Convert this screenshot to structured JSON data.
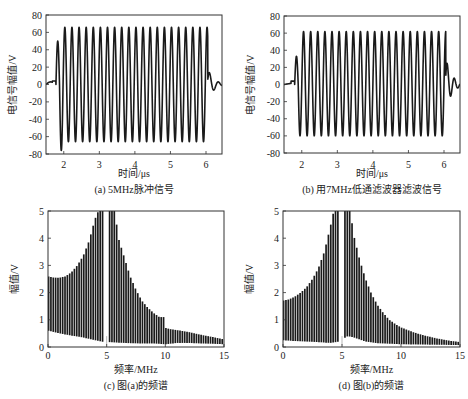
{
  "chart_data": [
    {
      "id": "a",
      "type": "line",
      "caption": "(a)  5MHz脉冲信号",
      "xlabel": "时间/μs",
      "ylabel": "电信号幅值/V",
      "xlim": [
        1.5,
        6.45
      ],
      "ylim": [
        -80,
        80
      ],
      "xticks": [
        2,
        3,
        4,
        5,
        6
      ],
      "yticks": [
        -80,
        -60,
        -40,
        -20,
        0,
        20,
        40,
        60,
        80
      ],
      "signal": {
        "frequency_mhz": 5,
        "start_us": 1.78,
        "end_us": 6.05,
        "peak_max": 66,
        "peak_min": -66,
        "first_peak": 50,
        "first_trough": -76,
        "ringdown_peak": 18,
        "inner_trough": -42
      }
    },
    {
      "id": "b",
      "type": "line",
      "caption": "(b)  用7MHz低通滤波器滤波信号",
      "xlabel": "时间/μs",
      "ylabel": "电信号幅值/V",
      "xlim": [
        1.5,
        6.45
      ],
      "ylim": [
        -80,
        80
      ],
      "xticks": [
        2,
        3,
        4,
        5,
        6
      ],
      "yticks": [
        -80,
        -60,
        -40,
        -20,
        0,
        20,
        40,
        60,
        80
      ],
      "signal": {
        "frequency_mhz": 5,
        "start_us": 1.8,
        "end_us": 6.05,
        "peak_max": 62,
        "peak_min": -60,
        "first_peak": 33,
        "first_trough": -55,
        "ringdown_peak": 31,
        "ringdown_second": 8
      }
    },
    {
      "id": "c",
      "type": "bar",
      "caption": "(c)  图(a)的频谱",
      "xlabel": "频率/MHz",
      "ylabel": "幅值/V",
      "xlim": [
        0,
        15
      ],
      "ylim": [
        0,
        5
      ],
      "xticks": [
        0,
        5,
        10,
        15
      ],
      "yticks": [
        0,
        1,
        2,
        3,
        4,
        5
      ],
      "envelope_top": [
        [
          0,
          2.6
        ],
        [
          0.5,
          2.55
        ],
        [
          1,
          2.55
        ],
        [
          1.5,
          2.6
        ],
        [
          2,
          2.75
        ],
        [
          2.5,
          3.0
        ],
        [
          3,
          3.35
        ],
        [
          3.5,
          3.9
        ],
        [
          4,
          4.7
        ],
        [
          4.3,
          5
        ],
        [
          5.7,
          5
        ],
        [
          6,
          4.0
        ],
        [
          6.5,
          3.3
        ],
        [
          7,
          2.6
        ],
        [
          7.5,
          2.1
        ],
        [
          8,
          1.7
        ],
        [
          8.5,
          1.45
        ],
        [
          9,
          1.25
        ],
        [
          9.5,
          1.1
        ],
        [
          9.9,
          1.1
        ],
        [
          10,
          0.7
        ],
        [
          10.5,
          0.65
        ],
        [
          11,
          0.62
        ],
        [
          12,
          0.55
        ],
        [
          13,
          0.45
        ],
        [
          14,
          0.37
        ],
        [
          15,
          0.28
        ]
      ],
      "envelope_bottom": [
        [
          0,
          0.6
        ],
        [
          1,
          0.5
        ],
        [
          2,
          0.42
        ],
        [
          3,
          0.35
        ],
        [
          4,
          0.25
        ],
        [
          4.8,
          0.18
        ],
        [
          5,
          0.1
        ],
        [
          5.2,
          0.18
        ],
        [
          6,
          0.16
        ],
        [
          7,
          0.14
        ],
        [
          8,
          0.13
        ],
        [
          9,
          0.13
        ],
        [
          10,
          0.1
        ],
        [
          11,
          0.15
        ],
        [
          12,
          0.15
        ],
        [
          13,
          0.13
        ],
        [
          14,
          0.12
        ],
        [
          15,
          0.1
        ]
      ],
      "line_spacing_mhz": 0.2
    },
    {
      "id": "d",
      "type": "bar",
      "caption": "(d)  图(b)的频谱",
      "xlabel": "频率/MHz",
      "ylabel": "幅值/V",
      "xlim": [
        0,
        15
      ],
      "ylim": [
        0,
        5
      ],
      "xticks": [
        0,
        5,
        10,
        15
      ],
      "yticks": [
        0,
        1,
        2,
        3,
        4,
        5
      ],
      "envelope_top": [
        [
          0,
          1.7
        ],
        [
          0.5,
          1.75
        ],
        [
          1,
          1.85
        ],
        [
          1.5,
          2.0
        ],
        [
          2,
          2.2
        ],
        [
          2.5,
          2.5
        ],
        [
          3,
          2.9
        ],
        [
          3.5,
          3.5
        ],
        [
          4,
          4.4
        ],
        [
          4.3,
          5
        ],
        [
          5.7,
          5
        ],
        [
          6,
          4.1
        ],
        [
          6.5,
          3.2
        ],
        [
          7,
          2.5
        ],
        [
          7.5,
          1.95
        ],
        [
          8,
          1.55
        ],
        [
          8.5,
          1.25
        ],
        [
          9,
          1.0
        ],
        [
          9.5,
          0.85
        ],
        [
          10,
          0.72
        ],
        [
          11,
          0.55
        ],
        [
          12,
          0.42
        ],
        [
          13,
          0.32
        ],
        [
          14,
          0.24
        ],
        [
          15,
          0.18
        ]
      ],
      "envelope_bottom": [
        [
          0,
          0.25
        ],
        [
          1,
          0.22
        ],
        [
          2,
          0.2
        ],
        [
          3,
          0.18
        ],
        [
          4,
          0.15
        ],
        [
          4.8,
          0.2
        ],
        [
          5,
          0.28
        ],
        [
          5.5,
          0.4
        ],
        [
          6,
          0.35
        ],
        [
          7,
          0.2
        ],
        [
          8,
          0.14
        ],
        [
          9,
          0.12
        ],
        [
          10,
          0.1
        ],
        [
          12,
          0.09
        ],
        [
          15,
          0.07
        ]
      ],
      "line_spacing_mhz": 0.2
    }
  ],
  "layout": {
    "panels": [
      {
        "id": "a",
        "left": 46,
        "top": 15,
        "right": 222,
        "bottom": 154,
        "caption_y": 193,
        "xlabel_y": 177,
        "tick_y": 168
      },
      {
        "id": "b",
        "left": 284,
        "top": 16,
        "right": 460,
        "bottom": 153,
        "caption_y": 193,
        "xlabel_y": 177,
        "tick_y": 168
      },
      {
        "id": "c",
        "left": 48,
        "top": 211,
        "right": 224,
        "bottom": 347,
        "caption_y": 389,
        "xlabel_y": 373,
        "tick_y": 359
      },
      {
        "id": "d",
        "left": 283,
        "top": 211,
        "right": 460,
        "bottom": 347,
        "caption_y": 389,
        "xlabel_y": 373,
        "tick_y": 359
      }
    ],
    "line_color": "#1a1a1a"
  }
}
